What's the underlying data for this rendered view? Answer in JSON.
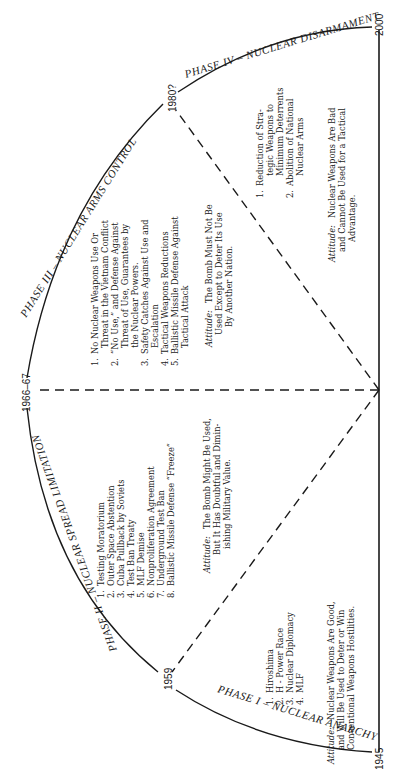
{
  "diagram": {
    "orientation": "rotated 90 degrees counter-clockwise",
    "markers": {
      "start": "1945",
      "phase1_end": "1959",
      "phase2_end": "1966–67",
      "phase3_end": "1980?",
      "end": "2000"
    },
    "phases": [
      {
        "id": "phase1",
        "title": "PHASE I – NUCLEAR ANARCHY",
        "items": [
          {
            "num": "1.",
            "lines": [
              "Hiroshima"
            ]
          },
          {
            "num": "2.",
            "lines": [
              "H - Power Race"
            ]
          },
          {
            "num": "3.",
            "lines": [
              "Nuclear Diplomacy"
            ]
          },
          {
            "num": "4.",
            "lines": [
              "MLF"
            ]
          }
        ],
        "attitude_label": "Attitude:",
        "attitude_lines": [
          "Nuclear Weapons Are Good,",
          "and Will Be Used to Deter or Win",
          "Conventional Weapons Hostilities."
        ]
      },
      {
        "id": "phase2",
        "title": "PHASE II – NUCLEAR SPREAD LIMITATION",
        "items": [
          {
            "num": "1.",
            "lines": [
              "Testing Moratorium"
            ]
          },
          {
            "num": "2.",
            "lines": [
              "Outer Space Abstention"
            ]
          },
          {
            "num": "3.",
            "lines": [
              "Cuba Pullback by Soviets"
            ]
          },
          {
            "num": "4.",
            "lines": [
              "Test Ban Treaty"
            ]
          },
          {
            "num": "5.",
            "lines": [
              "MLF Demise"
            ]
          },
          {
            "num": "6.",
            "lines": [
              "Nonproliferation Agreement"
            ]
          },
          {
            "num": "7.",
            "lines": [
              "Underground Test Ban"
            ]
          },
          {
            "num": "8.",
            "lines": [
              "Ballistic Missile Defense “Freeze”"
            ]
          }
        ],
        "attitude_label": "Attitude:",
        "attitude_lines": [
          "The Bomb Might Be Used,",
          "But It Has Doubtful and Dimin-",
          "ishing Military Value."
        ]
      },
      {
        "id": "phase3",
        "title": "PHASE III – NUCLEAR ARMS CONTROL",
        "items": [
          {
            "num": "1.",
            "lines": [
              "No Nuclear Weapons Use Or",
              "Threat in the Vietnam Conflict"
            ]
          },
          {
            "num": "2.",
            "lines": [
              "“No Use,” and Defense Against",
              "Threat of Use, Guarantees by",
              "the Nuclear Powers."
            ]
          },
          {
            "num": "3.",
            "lines": [
              "Safety Catches Against Use and",
              "Escalation"
            ]
          },
          {
            "num": "4.",
            "lines": [
              "Tactical Weapons Reductions"
            ]
          },
          {
            "num": "5.",
            "lines": [
              "Ballistic Missile Defense Against",
              "Tactical Attack"
            ]
          }
        ],
        "attitude_label": "Attitude:",
        "attitude_lines": [
          "The Bomb Must Not Be",
          "Used Except to Deter Its Use",
          "By Another Nation."
        ]
      },
      {
        "id": "phase4",
        "title": "PHASE IV – NUCLEAR DISARMAMENT",
        "items": [
          {
            "num": "1.",
            "lines": [
              "Reduction of Stra-",
              "tegic Weapons to",
              "Minimum Deterrents"
            ]
          },
          {
            "num": "2.",
            "lines": [
              "Abolition of National",
              "Nuclear Arms"
            ]
          }
        ],
        "attitude_label": "Attitude:",
        "attitude_lines": [
          "Nuclear Weapons Are Bad",
          "and Cannot Be Used for a Tactical",
          "Advantage."
        ]
      }
    ],
    "colors": {
      "ink": "#1a1a1a",
      "paper": "#ffffff"
    }
  }
}
